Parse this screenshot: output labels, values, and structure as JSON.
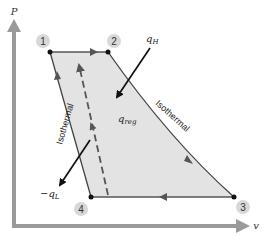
{
  "diagram": {
    "axes": {
      "y_label": "P",
      "x_label": "v"
    },
    "states": [
      {
        "id": "1",
        "label": "1"
      },
      {
        "id": "2",
        "label": "2"
      },
      {
        "id": "3",
        "label": "3"
      },
      {
        "id": "4",
        "label": "4"
      }
    ],
    "processes": {
      "top_isothermal_label": "Isothermal",
      "left_isothermal_label": "Isothermal"
    },
    "heat": {
      "q_H": "q",
      "q_H_sub": "H",
      "q_L_prefix": "−q",
      "q_L_sub": "L",
      "q_reg": "q",
      "q_reg_sub": "reg"
    },
    "colors": {
      "axis": "#9a9a9a",
      "fill": "#e3e3e3",
      "cycle_line": "#555555",
      "arrow": "#111111",
      "state_circle": "#d8d8d8"
    }
  }
}
